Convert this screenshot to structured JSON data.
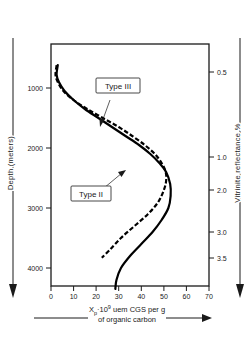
{
  "chart_data": {
    "type": "line",
    "title": "",
    "xlabel": "Xₚ·10⁹ uem CGS per g of organic carbon",
    "xlabel_line1": "X",
    "xlabel_sub": "p",
    "xlabel_mid": "·10",
    "xlabel_sup": "9",
    "xlabel_rest": " uem CGS per g",
    "xlabel_line2": "of organic carbon",
    "ylabel": "Depth (meters)",
    "y2label": "Vitrinite reflectance %",
    "xlim": [
      0,
      70
    ],
    "ylim": [
      4500,
      400
    ],
    "grid": false,
    "legend_position": "inline-annotation",
    "x_ticks": [
      "0",
      "10",
      "20",
      "30",
      "40",
      "50",
      "60",
      "70"
    ],
    "x_tick_values": [
      0,
      10,
      20,
      30,
      40,
      50,
      60,
      70
    ],
    "y_ticks": [
      "1000",
      "2000",
      "3000",
      "4000"
    ],
    "y_tick_values": [
      1000,
      2000,
      3000,
      4000
    ],
    "y2_ticks": [
      "0.5",
      "1.0",
      "2.0",
      "3.0",
      "3.5"
    ],
    "y2_tick_values": [
      0.5,
      1.0,
      2.0,
      3.0,
      3.5
    ],
    "y2_tick_pixels": [
      72,
      157,
      190,
      232,
      258
    ],
    "series": [
      {
        "name": "Type III",
        "style": "solid",
        "label": "Type III",
        "points": [
          [
            3,
            620
          ],
          [
            2.5,
            780
          ],
          [
            3.5,
            900
          ],
          [
            6,
            1050
          ],
          [
            10,
            1200
          ],
          [
            15,
            1350
          ],
          [
            21,
            1500
          ],
          [
            27,
            1650
          ],
          [
            33,
            1800
          ],
          [
            39,
            1950
          ],
          [
            44,
            2100
          ],
          [
            48,
            2250
          ],
          [
            51,
            2400
          ],
          [
            52.8,
            2600
          ],
          [
            53,
            2800
          ],
          [
            52,
            3000
          ],
          [
            49,
            3200
          ],
          [
            45,
            3400
          ],
          [
            40,
            3600
          ],
          [
            35,
            3800
          ],
          [
            31,
            4000
          ],
          [
            29,
            4200
          ],
          [
            28.5,
            4350
          ]
        ]
      },
      {
        "name": "Type II",
        "style": "dashed",
        "label": "Type II",
        "points": [
          [
            2.5,
            620
          ],
          [
            2,
            780
          ],
          [
            3,
            900
          ],
          [
            5.5,
            1050
          ],
          [
            10,
            1200
          ],
          [
            16,
            1350
          ],
          [
            23,
            1500
          ],
          [
            30,
            1650
          ],
          [
            36,
            1800
          ],
          [
            41.5,
            1950
          ],
          [
            46,
            2100
          ],
          [
            49,
            2250
          ],
          [
            50.8,
            2400
          ],
          [
            51,
            2550
          ],
          [
            50,
            2700
          ],
          [
            47.5,
            2900
          ],
          [
            43,
            3100
          ],
          [
            37,
            3300
          ],
          [
            31,
            3500
          ],
          [
            26,
            3700
          ],
          [
            22.5,
            3830
          ]
        ]
      }
    ],
    "annotations": [
      {
        "text": "Type III",
        "target_series": "Type III",
        "box_x": 96,
        "box_y": 86
      },
      {
        "text": "Type II",
        "target_series": "Type II",
        "box_x": 78,
        "box_y": 192
      }
    ]
  }
}
